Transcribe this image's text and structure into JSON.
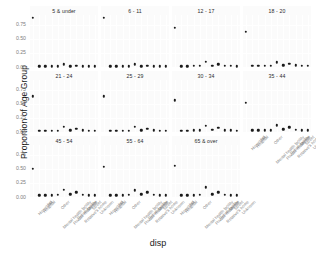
{
  "chart_data": {
    "type": "scatter",
    "title": "",
    "xlabel": "disp",
    "ylabel": "Proportion of Age Group",
    "ylim": [
      0,
      0.9
    ],
    "yticks": [
      0.0,
      0.25,
      0.5,
      0.75
    ],
    "ytick_labels": [
      "0.00",
      "0.25",
      "0.50",
      "0.75"
    ],
    "grid": true,
    "legend_position": "none",
    "facet_wrap": "age_group",
    "facet_rows": 3,
    "facet_cols": 4,
    "categories": [
      "Homeless",
      "Hospital",
      "Jail",
      "Mental health facility",
      "Other",
      "Private residence",
      "Rehab facility",
      "Relative's home",
      "Shelter",
      "Street",
      "Unknown"
    ],
    "panels": [
      {
        "label": "5 & under",
        "values": [
          0.87,
          0.01,
          0.01,
          0.01,
          0.01,
          0.05,
          0.01,
          0.02,
          0.01,
          0.01,
          0.01
        ]
      },
      {
        "label": "6 - 11",
        "values": [
          0.87,
          0.01,
          0.01,
          0.01,
          0.01,
          0.05,
          0.01,
          0.02,
          0.01,
          0.01,
          0.01
        ]
      },
      {
        "label": "12 - 17",
        "values": [
          0.69,
          0.01,
          0.01,
          0.02,
          0.02,
          0.09,
          0.02,
          0.05,
          0.02,
          0.02,
          0.01
        ]
      },
      {
        "label": "18 - 20",
        "values": [
          0.62,
          0.02,
          0.02,
          0.02,
          0.02,
          0.08,
          0.03,
          0.06,
          0.03,
          0.02,
          0.02
        ]
      },
      {
        "label": "21 - 24",
        "values": [
          0.63,
          0.02,
          0.02,
          0.02,
          0.02,
          0.09,
          0.03,
          0.06,
          0.03,
          0.02,
          0.02
        ]
      },
      {
        "label": "25 - 29",
        "values": [
          0.63,
          0.02,
          0.02,
          0.02,
          0.02,
          0.09,
          0.03,
          0.06,
          0.03,
          0.02,
          0.02
        ]
      },
      {
        "label": "30 - 34",
        "values": [
          0.56,
          0.02,
          0.02,
          0.03,
          0.03,
          0.11,
          0.04,
          0.07,
          0.03,
          0.03,
          0.02
        ]
      },
      {
        "label": "35 - 44",
        "values": [
          0.52,
          0.03,
          0.03,
          0.03,
          0.03,
          0.12,
          0.05,
          0.08,
          0.04,
          0.03,
          0.03
        ]
      },
      {
        "label": "45 - 54",
        "values": [
          0.5,
          0.03,
          0.03,
          0.03,
          0.04,
          0.13,
          0.05,
          0.08,
          0.04,
          0.03,
          0.03
        ]
      },
      {
        "label": "55 - 64",
        "values": [
          0.53,
          0.03,
          0.03,
          0.03,
          0.04,
          0.12,
          0.05,
          0.08,
          0.04,
          0.03,
          0.03
        ]
      },
      {
        "label": "65 & over",
        "values": [
          0.55,
          0.03,
          0.03,
          0.03,
          0.04,
          0.17,
          0.05,
          0.08,
          0.04,
          0.03,
          0.03
        ]
      }
    ]
  }
}
